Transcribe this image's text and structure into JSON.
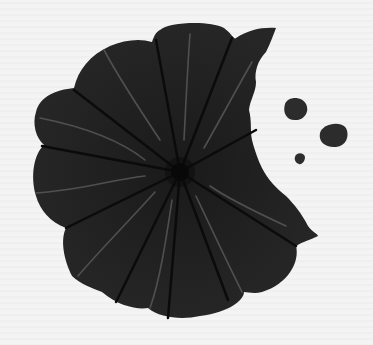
{
  "image": {
    "subject": "bitten-cookie",
    "description": "Dark scalloped cookie with radial segments, a bite taken out on the right, and three crumbs",
    "colors": {
      "background": "#f1f1f1",
      "cookie": "#232323",
      "segment_lines": "#0e0e0e",
      "veins": "#5a5a5a",
      "center": "#080808",
      "crumbs": "#2e2e2e"
    },
    "segments": 10,
    "crumbs": [
      {
        "cx": 295,
        "cy": 110,
        "r": 11
      },
      {
        "cx": 333,
        "cy": 135,
        "r": 12
      },
      {
        "cx": 300,
        "cy": 158,
        "r": 5
      }
    ]
  }
}
